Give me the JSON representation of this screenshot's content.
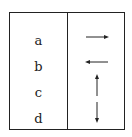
{
  "diagram": {
    "rows": [
      {
        "label": "a",
        "arrow": "right-arrow"
      },
      {
        "label": "b",
        "arrow": "left-arrow"
      },
      {
        "label": "c",
        "arrow": "up-arrow"
      },
      {
        "label": "d",
        "arrow": "down-arrow"
      }
    ],
    "colors": {
      "line": "#222222",
      "background": "#ffffff"
    }
  }
}
